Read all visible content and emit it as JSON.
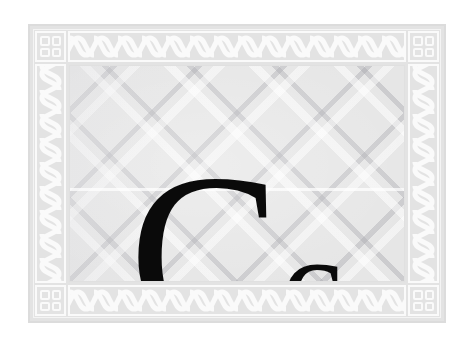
{
  "card": {
    "name": "alphabet-flashcard",
    "letter_pair": "Cc",
    "uppercase_letter": "C",
    "lowercase_letter": "c",
    "letter_color": "#0a0a0a",
    "background_color": "#e6e6e6",
    "frame_color": "#e3e3e3",
    "ornament_color": "#fafafa"
  },
  "frame": {
    "style_name": "celtic-braid-border",
    "corners": [
      {
        "name": "corner-top-left",
        "ornament": "four-dot-square"
      },
      {
        "name": "corner-top-right",
        "ornament": "four-dot-square"
      },
      {
        "name": "corner-bottom-left",
        "ornament": "four-dot-square"
      },
      {
        "name": "corner-bottom-right",
        "ornament": "four-dot-square"
      }
    ],
    "bands": [
      {
        "name": "braid-top",
        "orientation": "horizontal",
        "ornament": "rope-braid"
      },
      {
        "name": "braid-bottom",
        "orientation": "horizontal",
        "ornament": "rope-braid"
      },
      {
        "name": "braid-left",
        "orientation": "vertical",
        "ornament": "rope-braid"
      },
      {
        "name": "braid-right",
        "orientation": "vertical",
        "ornament": "rope-braid"
      }
    ]
  },
  "texture": {
    "name": "diagonal-lattice",
    "description": "crosshatch diagonal lattice weave"
  }
}
